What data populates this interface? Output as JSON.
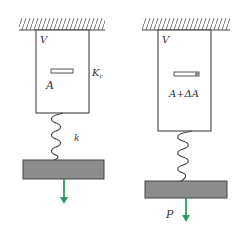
{
  "diagram": {
    "type": "physics-schematic",
    "colors": {
      "line": "#444444",
      "plate_fill": "#8c8c8c",
      "arrow": "#2e9a5e",
      "hatch": "#555555",
      "slot_mark": "#777777"
    },
    "left": {
      "vessel_label": "V",
      "area_label": "A",
      "stiffness_label": "K",
      "stiffness_subscript": "c",
      "spring_label": "k"
    },
    "right": {
      "vessel_label": "V",
      "area_label": "A+ΔA",
      "force_label": "P"
    }
  }
}
